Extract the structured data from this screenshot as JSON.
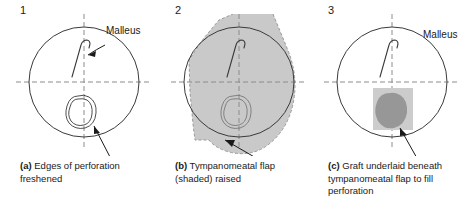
{
  "figure": {
    "panel_count": 3,
    "background_color": "#ffffff",
    "line_color": "#333333",
    "axis_color": "#888888",
    "flap_shade_color": "#c9c9c9",
    "graft_patch_color": "#c9c9c9",
    "graft_blob_color": "#949494"
  },
  "panels": [
    {
      "number": "1",
      "annotation_label": "Malleus",
      "caption_prefix": "(a)",
      "caption_text": "Edges of perforation freshened",
      "features": [
        "tympanic-membrane-circle",
        "crosshair-axes",
        "malleus-handle",
        "perforation-outline",
        "pointer-arrow"
      ]
    },
    {
      "number": "2",
      "annotation_label": "Malleus",
      "caption_prefix": "(b)",
      "caption_text": "Tympanomeatal flap (shaded) raised",
      "features": [
        "tympanic-membrane-circle",
        "crosshair-axes",
        "malleus-handle",
        "perforation-outline",
        "shaded-flap",
        "pointer-arrow"
      ]
    },
    {
      "number": "3",
      "annotation_label": "",
      "caption_prefix": "(c)",
      "caption_text": "Graft underlaid beneath tympanomeatal flap to fill perforation",
      "features": [
        "tympanic-membrane-circle",
        "crosshair-axes",
        "malleus-handle",
        "graft-patch",
        "graft-blob",
        "pointer-arrow"
      ]
    }
  ]
}
